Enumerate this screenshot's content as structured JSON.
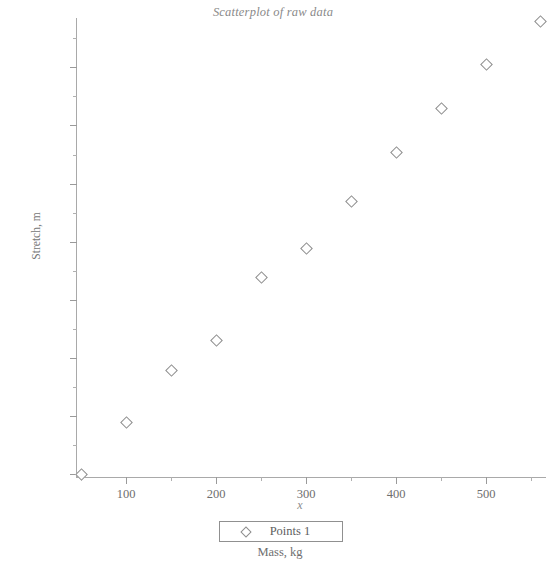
{
  "chart_data": {
    "type": "scatter",
    "title": "Scatterplot of raw data",
    "xlabel": "Mass, kg",
    "ylabel": "Stretch, m",
    "x_var_label": "x",
    "xlim": [
      0,
      570
    ],
    "ylim": [
      0.095,
      0.885
    ],
    "grid": false,
    "legend_position": "bottom-center",
    "x_ticks": [
      100,
      200,
      300,
      400,
      500
    ],
    "x_tick_labels": [
      "100",
      "200",
      "300",
      "400",
      "500"
    ],
    "x_minor_ticks": [
      50,
      150,
      250,
      350,
      450,
      550
    ],
    "y_ticks": [
      0.1,
      0.2,
      0.3,
      0.4,
      0.5,
      0.6,
      0.7,
      0.8
    ],
    "y_tick_labels": [
      "0.1",
      "0.2",
      "0.3",
      "0.4",
      "0.5",
      "0.6",
      "0.7",
      "0.8"
    ],
    "y_minor_ticks": [
      0.15,
      0.25,
      0.35,
      0.45,
      0.55,
      0.65,
      0.75,
      0.85
    ],
    "series": [
      {
        "name": "Points 1",
        "marker": "diamond-open",
        "color": "#8d8d8d",
        "x": [
          50,
          100,
          150,
          200,
          250,
          300,
          350,
          400,
          450,
          500,
          560
        ],
        "y": [
          0.1,
          0.19,
          0.28,
          0.33,
          0.44,
          0.49,
          0.57,
          0.655,
          0.73,
          0.805,
          0.88
        ]
      }
    ],
    "legend": [
      {
        "label": "Points 1",
        "marker": "diamond-open"
      }
    ]
  },
  "axis_color": "#a9a9a9",
  "text_color": "#6e6e6e"
}
